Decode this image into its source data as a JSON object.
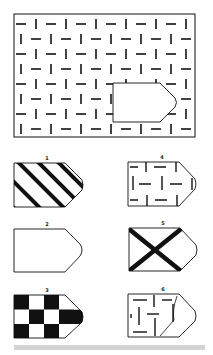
{
  "puzzle": {
    "type": "pattern-completion",
    "main_pattern": "dash-brick-pattern",
    "missing_piece_shape": "pentagon-arrow-right"
  },
  "options": [
    {
      "label": "1",
      "pattern": "diagonal-stripes"
    },
    {
      "label": "2",
      "pattern": "blank"
    },
    {
      "label": "3",
      "pattern": "checkerboard"
    },
    {
      "label": "4",
      "pattern": "dash-brick-pattern"
    },
    {
      "label": "5",
      "pattern": "x-cross"
    },
    {
      "label": "6",
      "pattern": "dash-brick-partial"
    }
  ],
  "colors": {
    "ink": "#111111",
    "bar": "#d4d4d4"
  }
}
